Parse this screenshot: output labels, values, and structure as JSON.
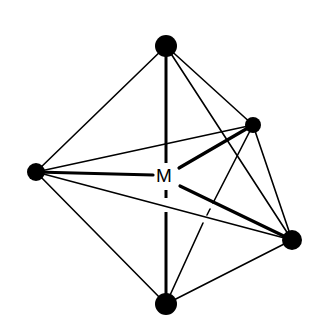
{
  "diagram": {
    "type": "octahedral-coordination-geometry",
    "center_label": "M",
    "colors": {
      "line": "#000000",
      "background": "#ffffff"
    },
    "vertices": [
      {
        "id": "top",
        "x": 166,
        "y": 46,
        "r": 11
      },
      {
        "id": "right-back",
        "x": 253,
        "y": 125,
        "r": 8
      },
      {
        "id": "left",
        "x": 36,
        "y": 172,
        "r": 9
      },
      {
        "id": "right-front",
        "x": 292,
        "y": 240,
        "r": 10
      },
      {
        "id": "bottom",
        "x": 166,
        "y": 304,
        "r": 11
      }
    ],
    "center": {
      "x": 166,
      "y": 176
    }
  }
}
